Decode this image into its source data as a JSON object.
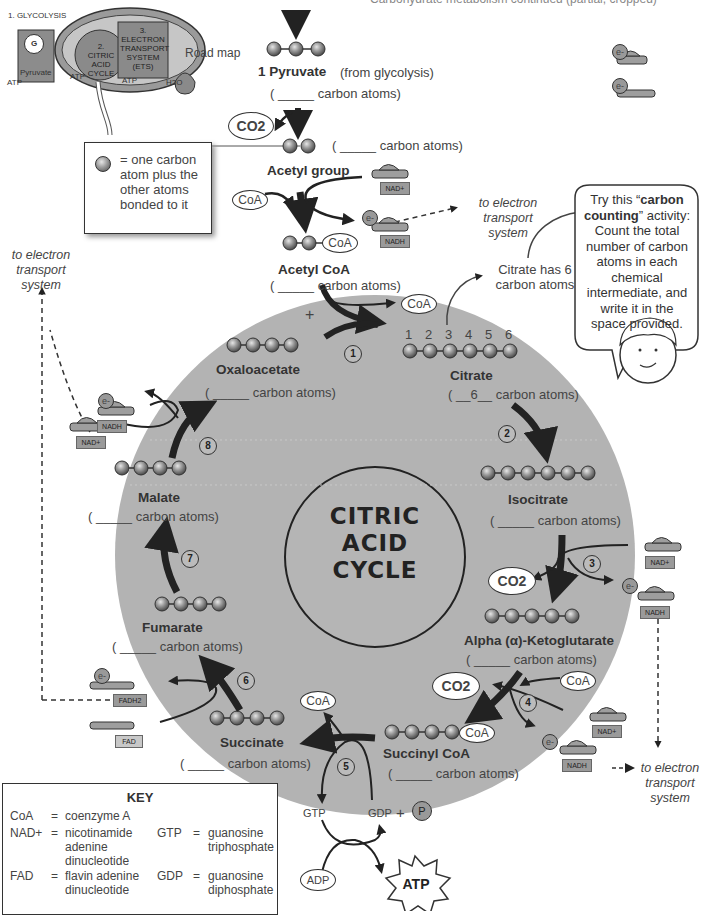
{
  "header": {
    "partial_text": "Carbohydrate metabolism continued (partial, cropped)"
  },
  "road_map": {
    "label": "Road map",
    "steps": [
      "1. GLYCOLYSIS",
      "2. CITRIC ACID CYCLE",
      "3. ELECTRON TRANSPORT SYSTEM (ETS)"
    ],
    "glucose": "G",
    "pyruvate": "Pyruvate",
    "atp": "ATP",
    "water": "H2O"
  },
  "legend_box": {
    "text": "= one carbon atom plus the other atoms bonded to it"
  },
  "carriers_legend": {
    "e": "e-"
  },
  "center": {
    "line1": "CITRIC",
    "line2": "ACID",
    "line3": "CYCLE"
  },
  "blank": "( _____ carbon atoms)",
  "molecules": {
    "pyruvate": {
      "name": "1 Pyruvate",
      "note": "(from glycolysis)",
      "carbons": 3,
      "blank": "( _____ carbon atoms)"
    },
    "acetyl_group": {
      "name": "Acetyl group",
      "carbons": 2,
      "blank": "( _____ carbon atoms)"
    },
    "acetyl_coa": {
      "name": "Acetyl CoA",
      "carbons": 2,
      "blank": "( _____ carbon atoms)"
    },
    "citrate": {
      "name": "Citrate",
      "carbons": 6,
      "blank": "( __6__ carbon atoms)",
      "numbers": [
        "1",
        "2",
        "3",
        "4",
        "5",
        "6"
      ]
    },
    "isocitrate": {
      "name": "Isocitrate",
      "carbons": 6,
      "blank": "( _____ carbon atoms)"
    },
    "alpha_kg": {
      "name": "Alpha (α)-Ketoglutarate",
      "carbons": 5,
      "blank": "( _____ carbon atoms)"
    },
    "succinyl_coa": {
      "name": "Succinyl CoA",
      "carbons": 4,
      "blank": "( _____ carbon atoms)"
    },
    "succinate": {
      "name": "Succinate",
      "carbons": 4,
      "blank": "( _____ carbon atoms)"
    },
    "fumarate": {
      "name": "Fumarate",
      "carbons": 4,
      "blank": "( _____ carbon atoms)"
    },
    "malate": {
      "name": "Malate",
      "carbons": 4,
      "blank": "( _____ carbon atoms)"
    },
    "oxaloacetate": {
      "name": "Oxaloacetate",
      "carbons": 4,
      "blank": "( _____ carbon atoms)"
    }
  },
  "labels": {
    "coa": "CoA",
    "co2": "CO2",
    "nad": "NAD+",
    "nadh": "NADH",
    "fad": "FAD",
    "fadh2": "FADH2",
    "gtp": "GTP",
    "gdp": "GDP",
    "plus": "+",
    "p": "P",
    "adp": "ADP",
    "atp": "ATP",
    "e": "e-",
    "to_ets": "to electron transport system",
    "citrate_note": "Citrate has 6 carbon atoms"
  },
  "steps": [
    "1",
    "2",
    "3",
    "4",
    "5",
    "6",
    "7",
    "8"
  ],
  "speech": {
    "pre": "Try this “",
    "bold": "carbon counting",
    "post": "” activity: Count the total number of carbon atoms in each chemical intermediate, and write it in the space provided."
  },
  "key": {
    "title": "KEY",
    "entries": [
      {
        "abbr": "CoA",
        "eq": "=",
        "def": "coenzyme A"
      },
      {
        "abbr": "NAD+",
        "eq": "=",
        "def": "nicotinamide adenine dinucleotide"
      },
      {
        "abbr": "FAD",
        "eq": "=",
        "def": "flavin adenine dinucleotide"
      },
      {
        "abbr": "GTP",
        "eq": "=",
        "def": "guanosine triphosphate"
      },
      {
        "abbr": "GDP",
        "eq": "=",
        "def": "guanosine diphosphate"
      }
    ]
  }
}
